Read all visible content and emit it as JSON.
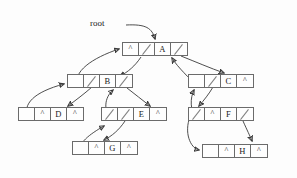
{
  "diagram": {
    "root_label": "root",
    "null_marker": "^",
    "background_color": "#fdfdfd",
    "line_color": "#3a3a3a",
    "box_border_color": "#6b6b6b",
    "nodes": [
      {
        "id": "A",
        "value": "A",
        "x": 122,
        "y": 42,
        "w": 66,
        "cells": [
          {
            "type": "null",
            "text": "^"
          },
          {
            "type": "link",
            "text": ""
          },
          {
            "type": "value",
            "text": "A"
          },
          {
            "type": "link",
            "text": ""
          }
        ]
      },
      {
        "id": "B",
        "value": "B",
        "x": 67,
        "y": 74,
        "w": 66,
        "cells": [
          {
            "type": "link",
            "text": ""
          },
          {
            "type": "link",
            "text": ""
          },
          {
            "type": "value",
            "text": "B"
          },
          {
            "type": "link",
            "text": ""
          }
        ]
      },
      {
        "id": "C",
        "value": "C",
        "x": 188,
        "y": 74,
        "w": 66,
        "cells": [
          {
            "type": "link",
            "text": ""
          },
          {
            "type": "link",
            "text": ""
          },
          {
            "type": "value",
            "text": "C"
          },
          {
            "type": "null",
            "text": "^"
          }
        ]
      },
      {
        "id": "D",
        "value": "D",
        "x": 18,
        "y": 107,
        "w": 66,
        "cells": [
          {
            "type": "link",
            "text": ""
          },
          {
            "type": "null",
            "text": "^"
          },
          {
            "type": "value",
            "text": "D"
          },
          {
            "type": "null",
            "text": "^"
          }
        ]
      },
      {
        "id": "E",
        "value": "E",
        "x": 101,
        "y": 107,
        "w": 66,
        "cells": [
          {
            "type": "link",
            "text": ""
          },
          {
            "type": "link",
            "text": ""
          },
          {
            "type": "value",
            "text": "E"
          },
          {
            "type": "null",
            "text": "^"
          }
        ]
      },
      {
        "id": "F",
        "value": "F",
        "x": 188,
        "y": 107,
        "w": 66,
        "cells": [
          {
            "type": "link",
            "text": ""
          },
          {
            "type": "null",
            "text": "^"
          },
          {
            "type": "value",
            "text": "F"
          },
          {
            "type": "link",
            "text": ""
          }
        ]
      },
      {
        "id": "G",
        "value": "G",
        "x": 72,
        "y": 141,
        "w": 66,
        "cells": [
          {
            "type": "link",
            "text": ""
          },
          {
            "type": "null",
            "text": "^"
          },
          {
            "type": "value",
            "text": "G"
          },
          {
            "type": "null",
            "text": "^"
          }
        ]
      },
      {
        "id": "H",
        "value": "H",
        "x": 202,
        "y": 144,
        "w": 66,
        "cells": [
          {
            "type": "link",
            "text": ""
          },
          {
            "type": "null",
            "text": "^"
          },
          {
            "type": "value",
            "text": "H"
          },
          {
            "type": "null",
            "text": "^"
          }
        ]
      }
    ],
    "edges": [
      {
        "name": "root-to-A",
        "from": "root",
        "to": "A"
      },
      {
        "name": "A-right-to-B",
        "from": "A",
        "to": "B"
      },
      {
        "name": "A-right-to-C",
        "from": "A",
        "to": "C"
      },
      {
        "name": "B-left-to-A",
        "from": "B",
        "to": "A"
      },
      {
        "name": "B-right-to-D",
        "from": "B",
        "to": "D"
      },
      {
        "name": "B-right-to-E",
        "from": "B",
        "to": "E"
      },
      {
        "name": "D-left-to-B",
        "from": "D",
        "to": "B"
      },
      {
        "name": "E-left-to-B",
        "from": "E",
        "to": "B"
      },
      {
        "name": "E-right-to-G",
        "from": "E",
        "to": "G"
      },
      {
        "name": "G-left-to-E",
        "from": "G",
        "to": "E"
      },
      {
        "name": "C-left-to-A",
        "from": "C",
        "to": "A"
      },
      {
        "name": "C-right-to-F",
        "from": "C",
        "to": "F"
      },
      {
        "name": "F-left-to-C",
        "from": "F",
        "to": "C"
      },
      {
        "name": "F-right-to-H",
        "from": "F",
        "to": "H"
      },
      {
        "name": "H-left-to-F",
        "from": "H",
        "to": "F"
      }
    ]
  }
}
